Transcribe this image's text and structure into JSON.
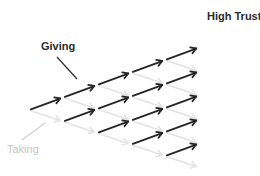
{
  "labels": {
    "giving": "Giving",
    "taking": "Taking",
    "high_trust": "High Trust"
  },
  "colors": {
    "giving_arrow": "#262626",
    "taking_arrow": "#e3e3e3",
    "giving_text": "#2b2b2b",
    "taking_text": "#c4c4c4",
    "background": "#ffffff"
  },
  "lattice": {
    "origin": [
      29,
      110
    ],
    "step_x": 34,
    "step_up_y": -12.5,
    "step_down_y": 11.5,
    "columns": 5,
    "description": "Recombining lattice of arrows: dark arrows point up-right (giving), light gray arrows point down-right (taking); the top path leads to 'High Trust'."
  },
  "annotations": {
    "giving_leader": [
      57,
      57,
      77,
      79
    ],
    "taking_leader": [
      22,
      140,
      45,
      123
    ]
  }
}
